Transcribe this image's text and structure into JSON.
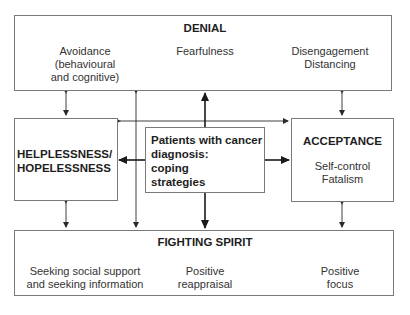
{
  "diagram": {
    "center": {
      "lines": [
        "Patients with cancer",
        "diagnosis:",
        "coping",
        "strategies"
      ]
    },
    "denial": {
      "title": "DENIAL",
      "items": [
        {
          "lines": [
            "Avoidance",
            "(behavioural",
            "and cognitive)"
          ]
        },
        {
          "lines": [
            "Fearfulness"
          ]
        },
        {
          "lines": [
            "Disengagement",
            "Distancing"
          ]
        }
      ]
    },
    "helplessness": {
      "lines": [
        "HELPLESSNESS/",
        "HOPELESSNESS"
      ]
    },
    "acceptance": {
      "title": "ACCEPTANCE",
      "items": [
        {
          "lines": [
            "Self-control",
            "Fatalism"
          ]
        }
      ]
    },
    "fighting_spirit": {
      "title": "FIGHTING SPIRIT",
      "items": [
        {
          "lines": [
            "Seeking social support",
            "and seeking information"
          ]
        },
        {
          "lines": [
            "Positive",
            "reappraisal"
          ]
        },
        {
          "lines": [
            "Positive",
            "focus"
          ]
        }
      ]
    }
  },
  "colors": {
    "line": "#3a3a3a",
    "box_border": "#7a7a7a",
    "text": "#2a2a2a"
  }
}
